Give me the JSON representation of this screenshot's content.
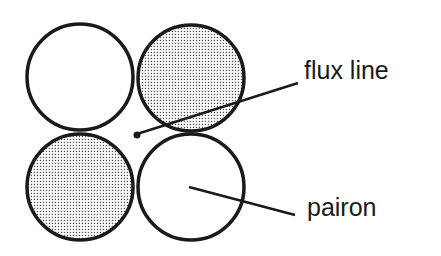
{
  "diagram": {
    "labels": {
      "flux_line": "flux line",
      "pairon": "pairon"
    },
    "circles": [
      {
        "name": "top-left",
        "cx": 80,
        "cy": 77,
        "r": 53,
        "filled": false
      },
      {
        "name": "top-right",
        "cx": 191,
        "cy": 78,
        "r": 53,
        "filled": true
      },
      {
        "name": "bottom-left",
        "cx": 80,
        "cy": 187,
        "r": 53,
        "filled": true
      },
      {
        "name": "bottom-right",
        "cx": 191,
        "cy": 187,
        "r": 53,
        "filled": false
      }
    ],
    "colors": {
      "stroke": "#1a1a1a",
      "dots": "#555555",
      "background": "#ffffff"
    }
  }
}
